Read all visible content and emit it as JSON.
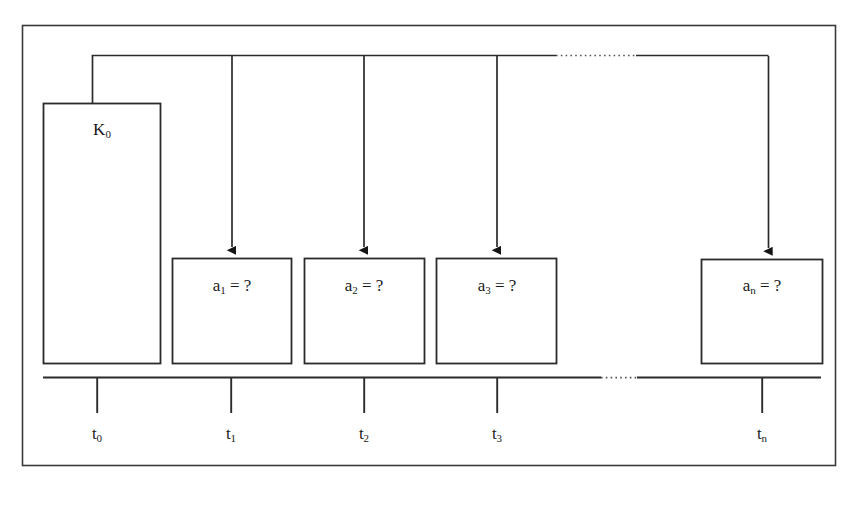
{
  "figure": {
    "title": "",
    "type": "timeline-cash-flow-diagram",
    "frame": {
      "border_color": "#333333"
    },
    "line_color": "#2b2b2b",
    "text_color": "#1a1a1a"
  },
  "initial_block": {
    "name": "K0",
    "label_main": "K",
    "label_sub": "0"
  },
  "payment_boxes": [
    {
      "id": "a1",
      "label_main": "a",
      "label_sub": "1",
      "label_tail": " = ?"
    },
    {
      "id": "a2",
      "label_main": "a",
      "label_sub": "2",
      "label_tail": " = ?"
    },
    {
      "id": "a3",
      "label_main": "a",
      "label_sub": "3",
      "label_tail": " = ?"
    },
    {
      "id": "an",
      "label_main": "a",
      "label_sub": "n",
      "label_tail": " = ?"
    }
  ],
  "timeline": {
    "ticks": [
      {
        "id": "t0",
        "label_main": "t",
        "label_sub": "0"
      },
      {
        "id": "t1",
        "label_main": "t",
        "label_sub": "1"
      },
      {
        "id": "t2",
        "label_main": "t",
        "label_sub": "2"
      },
      {
        "id": "t3",
        "label_main": "t",
        "label_sub": "3"
      },
      {
        "id": "tn",
        "label_main": "t",
        "label_sub": "n"
      }
    ],
    "has_ellipsis_gap": true
  },
  "connector_bus": {
    "description": "horizontal distribution line from K0 to each payment arrow",
    "has_ellipsis_gap": true,
    "arrow_count": 4
  }
}
